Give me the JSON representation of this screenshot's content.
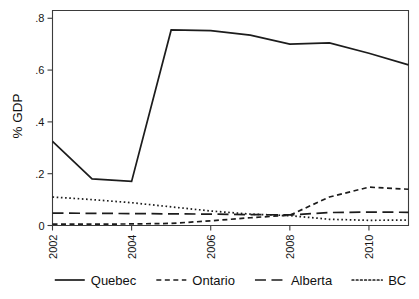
{
  "chart_data": {
    "type": "line",
    "title": "",
    "xlabel": "",
    "ylabel": "% GDP",
    "x": [
      2002,
      2003,
      2004,
      2005,
      2006,
      2007,
      2008,
      2009,
      2010,
      2011
    ],
    "xlim": [
      2002,
      2011
    ],
    "ylim": [
      0,
      0.83
    ],
    "xticks": [
      2002,
      2004,
      2006,
      2008,
      2010
    ],
    "xtick_labels": [
      "2002",
      "2004",
      "2006",
      "2008",
      "2010"
    ],
    "yticks": [
      0,
      0.2,
      0.4,
      0.6,
      0.8
    ],
    "ytick_labels": [
      "0",
      ".2",
      ".4",
      ".6",
      ".8"
    ],
    "grid": false,
    "legend_position": "bottom",
    "series": [
      {
        "name": "Quebec",
        "style": "solid",
        "dash": "none",
        "color": "#1c1c1c",
        "values": [
          0.325,
          0.18,
          0.17,
          0.755,
          0.752,
          0.735,
          0.7,
          0.705,
          0.665,
          0.62
        ]
      },
      {
        "name": "Ontario",
        "style": "short-dash",
        "dash": "5,3.5",
        "color": "#1c1c1c",
        "values": [
          0.005,
          0.005,
          0.006,
          0.008,
          0.018,
          0.03,
          0.04,
          0.11,
          0.148,
          0.14
        ]
      },
      {
        "name": "Alberta",
        "style": "long-dash",
        "dash": "11,5.5",
        "color": "#1c1c1c",
        "values": [
          0.048,
          0.047,
          0.046,
          0.045,
          0.044,
          0.042,
          0.041,
          0.05,
          0.052,
          0.051
        ]
      },
      {
        "name": "BC",
        "style": "dotted",
        "dash": "1.6,2.6",
        "color": "#1c1c1c",
        "values": [
          0.11,
          0.1,
          0.088,
          0.072,
          0.056,
          0.044,
          0.038,
          0.024,
          0.02,
          0.021
        ]
      }
    ]
  },
  "axes": {
    "y_title": "% GDP"
  },
  "legend": {
    "items": [
      {
        "label": "Quebec"
      },
      {
        "label": "Ontario"
      },
      {
        "label": "Alberta"
      },
      {
        "label": "BC"
      }
    ]
  }
}
